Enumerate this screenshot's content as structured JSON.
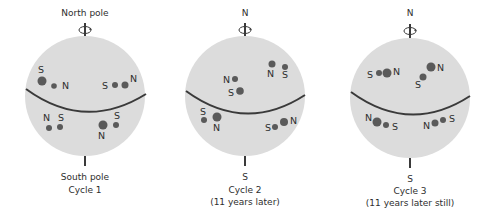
{
  "colors": {
    "sphere": "#dcdcdc",
    "spot": "#5a5a5a",
    "line": "#3a3a3a",
    "text": "#2e2e2e"
  },
  "panels": [
    {
      "id": "cycle1",
      "top_label": "North pole",
      "bottom_label": "South pole",
      "caption_line1": "Cycle 1",
      "caption_line2": "",
      "center": [
        85,
        96
      ],
      "radius": 60,
      "equator": {
        "left": [
          26,
          89
        ],
        "mid": [
          85,
          112
        ],
        "right": [
          146,
          94
        ]
      },
      "spots": [
        {
          "x": 42,
          "y": 81,
          "r": 4.5
        },
        {
          "x": 54,
          "y": 86,
          "r": 2.8
        },
        {
          "x": 115,
          "y": 85,
          "r": 3
        },
        {
          "x": 125,
          "y": 85,
          "r": 3.5
        },
        {
          "x": 49,
          "y": 128,
          "r": 3
        },
        {
          "x": 60,
          "y": 127,
          "r": 3
        },
        {
          "x": 103,
          "y": 125,
          "r": 4.5
        },
        {
          "x": 116,
          "y": 125,
          "r": 3
        }
      ],
      "labels": [
        {
          "text": "S",
          "x": 38,
          "y": 73
        },
        {
          "text": "N",
          "x": 62,
          "y": 89
        },
        {
          "text": "S",
          "x": 102,
          "y": 89
        },
        {
          "text": "N",
          "x": 130,
          "y": 82
        },
        {
          "text": "N",
          "x": 43,
          "y": 121
        },
        {
          "text": "S",
          "x": 58,
          "y": 121
        },
        {
          "text": "S",
          "x": 114,
          "y": 119
        },
        {
          "text": "N",
          "x": 98,
          "y": 139
        }
      ]
    },
    {
      "id": "cycle2",
      "top_label": "N",
      "bottom_label": "S",
      "caption_line1": "Cycle 2",
      "caption_line2": "(11 years later)",
      "center": [
        245,
        96
      ],
      "radius": 60,
      "equator": {
        "left": [
          186,
          91
        ],
        "mid": [
          245,
          113
        ],
        "right": [
          305,
          95
        ]
      },
      "spots": [
        {
          "x": 272,
          "y": 64,
          "r": 3.5
        },
        {
          "x": 285,
          "y": 67,
          "r": 3
        },
        {
          "x": 235,
          "y": 79,
          "r": 3
        },
        {
          "x": 240,
          "y": 91,
          "r": 3.8
        },
        {
          "x": 204,
          "y": 120,
          "r": 3
        },
        {
          "x": 217,
          "y": 117,
          "r": 4.5
        },
        {
          "x": 275,
          "y": 127,
          "r": 3
        },
        {
          "x": 284,
          "y": 122,
          "r": 4
        }
      ],
      "labels": [
        {
          "text": "N",
          "x": 267,
          "y": 77
        },
        {
          "text": "S",
          "x": 282,
          "y": 78
        },
        {
          "text": "N",
          "x": 223,
          "y": 83
        },
        {
          "text": "S",
          "x": 228,
          "y": 96
        },
        {
          "text": "S",
          "x": 200,
          "y": 115
        },
        {
          "text": "N",
          "x": 213,
          "y": 131
        },
        {
          "text": "S",
          "x": 265,
          "y": 131
        },
        {
          "text": "N",
          "x": 290,
          "y": 124
        }
      ]
    },
    {
      "id": "cycle3",
      "top_label": "N",
      "bottom_label": "S",
      "caption_line1": "Cycle 3",
      "caption_line2": "(11 years later still)",
      "center": [
        410,
        98
      ],
      "radius": 60,
      "equator": {
        "left": [
          351,
          92
        ],
        "mid": [
          410,
          114
        ],
        "right": [
          470,
          96
        ]
      },
      "spots": [
        {
          "x": 379,
          "y": 73,
          "r": 3
        },
        {
          "x": 387,
          "y": 73,
          "r": 4.5
        },
        {
          "x": 423,
          "y": 77,
          "r": 3.5
        },
        {
          "x": 431,
          "y": 67,
          "r": 4.5
        },
        {
          "x": 377,
          "y": 122,
          "r": 4.5
        },
        {
          "x": 386,
          "y": 125,
          "r": 3
        },
        {
          "x": 435,
          "y": 123,
          "r": 3.5
        },
        {
          "x": 443,
          "y": 120,
          "r": 3
        }
      ],
      "labels": [
        {
          "text": "S",
          "x": 367,
          "y": 78
        },
        {
          "text": "N",
          "x": 393,
          "y": 75
        },
        {
          "text": "S",
          "x": 415,
          "y": 88
        },
        {
          "text": "N",
          "x": 437,
          "y": 71
        },
        {
          "text": "N",
          "x": 365,
          "y": 121
        },
        {
          "text": "S",
          "x": 392,
          "y": 130
        },
        {
          "text": "N",
          "x": 423,
          "y": 129
        },
        {
          "text": "S",
          "x": 449,
          "y": 122
        }
      ]
    }
  ]
}
